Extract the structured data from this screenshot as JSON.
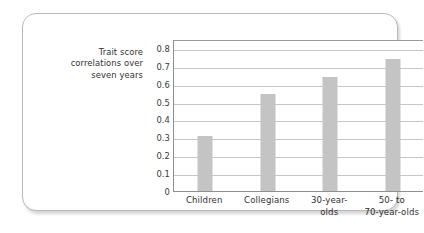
{
  "axis_caption": {
    "lines": [
      "Trait score",
      "correlations over",
      "seven years"
    ]
  },
  "colors": {
    "bar": "#c4c4c4",
    "gridline": "#c6c6c6",
    "axis": "#8f8f8f",
    "text": "#2f2f2f",
    "card_border": "#b9b9b9",
    "background": "#ffffff"
  },
  "chart_data": {
    "type": "bar",
    "title": "",
    "subtitle": "",
    "xlabel": "",
    "ylabel": "Trait score correlations over seven years",
    "categories": [
      "Children",
      "Collegians",
      "30-year-olds",
      "50- to 70-year-olds"
    ],
    "category_lines": [
      [
        "Children"
      ],
      [
        "Collegians"
      ],
      [
        "30-year-",
        "olds"
      ],
      [
        "50- to",
        "70-year-olds"
      ]
    ],
    "values": [
      0.31,
      0.54,
      0.64,
      0.74
    ],
    "ylim": [
      0,
      0.85
    ],
    "yticks": [
      0.8,
      0.7,
      0.6,
      0.5,
      0.4,
      0.3,
      0.2,
      0.1,
      0
    ],
    "ytick_labels": [
      "0.8",
      "0.7",
      "0.6",
      "0.5",
      "0.4",
      "0.3",
      "0.2",
      "0.1",
      "0"
    ],
    "grid": true,
    "grid_axis": "y",
    "legend": false,
    "legend_position": "none",
    "bar_color": "#c4c4c4"
  }
}
